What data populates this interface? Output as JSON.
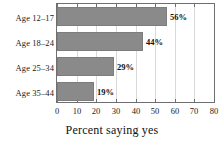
{
  "chart_data": {
    "type": "bar",
    "orientation": "horizontal",
    "title": "",
    "xlabel": "Percent saying yes",
    "ylabel": "",
    "categories": [
      "Age 12–17",
      "Age 18–24",
      "Age 25–34",
      "Age 35–44"
    ],
    "values": [
      56,
      44,
      29,
      19
    ],
    "value_labels": [
      "56%",
      "44%",
      "29%",
      "19%"
    ],
    "xlim": [
      0,
      80
    ],
    "xticks": [
      0,
      10,
      20,
      30,
      40,
      50,
      60,
      70,
      80
    ],
    "xtick_labels": [
      "0",
      "10",
      "20",
      "30",
      "40",
      "50",
      "60",
      "70",
      "80"
    ],
    "grid": true,
    "grid_axis": "x",
    "legend": false,
    "bar_color": "#8a8a8a",
    "bar_edge_color": "#7d7d7d",
    "grid_color": "#d9d9d9",
    "frame_color": "#6f6f6f",
    "background_color": "#ffffff",
    "text_color": "#1a1a1a"
  }
}
